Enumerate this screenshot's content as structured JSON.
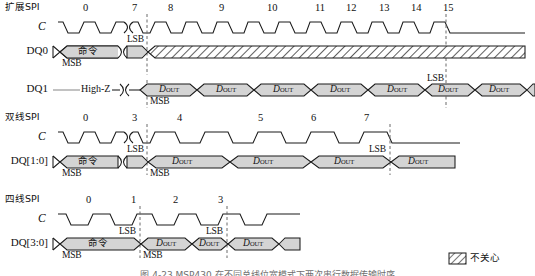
{
  "figure": {
    "caption": "图 4-23  MSP430 在不同总线位宽模式下两次串行数据传输时序",
    "legend": {
      "label": "不关心",
      "swatch": "hatched-box"
    },
    "colors": {
      "signal_fill": "#d4d4d4",
      "line": "#1a1a1a",
      "dashed": "#5a5a5a",
      "background": "#ffffff"
    }
  },
  "sections": [
    {
      "id": "extended-spi",
      "title": "扩展SPI",
      "clock": {
        "pin": "C",
        "cycles": [
          "0",
          "7",
          "8",
          "9",
          "10",
          "11",
          "12",
          "13",
          "14",
          "15"
        ],
        "break_after_index": 0
      },
      "rows": [
        {
          "pin": "DQ0",
          "segments": [
            {
              "type": "bus",
              "label": "命令",
              "lang": "cjk"
            },
            {
              "type": "break"
            },
            {
              "type": "bus",
              "label": ""
            },
            {
              "type": "hatch",
              "label": ""
            }
          ],
          "marks": [
            {
              "text": "MSB",
              "at": "command-start"
            },
            {
              "text": "LSB",
              "at": "command-end"
            }
          ]
        },
        {
          "pin": "DQ1",
          "segments": [
            {
              "type": "highz",
              "label": "High-Z"
            },
            {
              "type": "break"
            },
            {
              "type": "cell",
              "label": "D",
              "sub": "OUT",
              "count": 8
            }
          ],
          "marks": [
            {
              "text": "MSB",
              "at": "data-start"
            },
            {
              "text": "LSB",
              "at": "data-end"
            }
          ]
        }
      ]
    },
    {
      "id": "dual-spi",
      "title": "双线SPI",
      "clock": {
        "pin": "C",
        "cycles": [
          "0",
          "3",
          "4",
          "5",
          "6",
          "7"
        ],
        "break_after_index": 0
      },
      "rows": [
        {
          "pin": "DQ[1:0]",
          "segments": [
            {
              "type": "bus",
              "label": "命令",
              "lang": "cjk"
            },
            {
              "type": "break"
            },
            {
              "type": "bus",
              "label": ""
            },
            {
              "type": "cell",
              "label": "D",
              "sub": "OUT",
              "count": 4
            }
          ],
          "marks": [
            {
              "text": "MSB",
              "at": "command-start"
            },
            {
              "text": "LSB",
              "at": "command-end"
            },
            {
              "text": "MSB",
              "at": "data-start"
            },
            {
              "text": "LSB",
              "at": "data-end"
            }
          ]
        }
      ]
    },
    {
      "id": "quad-spi",
      "title": "四线SPI",
      "clock": {
        "pin": "C",
        "cycles": [
          "0",
          "1",
          "2",
          "3"
        ],
        "break_after_index": -1
      },
      "rows": [
        {
          "pin": "DQ[3:0]",
          "segments": [
            {
              "type": "bus",
              "label": "命令",
              "lang": "cjk"
            },
            {
              "type": "cell",
              "label": "D",
              "sub": "OUT",
              "count": 3
            }
          ],
          "marks": [
            {
              "text": "MSB",
              "at": "command-start"
            },
            {
              "text": "LSB",
              "at": "command-end"
            },
            {
              "text": "MSB",
              "at": "data-start"
            },
            {
              "text": "LSB",
              "at": "data-end"
            }
          ]
        }
      ]
    }
  ],
  "labels": {
    "msb": "MSB",
    "lsb": "LSB",
    "highz": "High-Z",
    "dout_main": "D",
    "dout_sub": "OUT",
    "command": "命令",
    "clock_pin": "C"
  }
}
